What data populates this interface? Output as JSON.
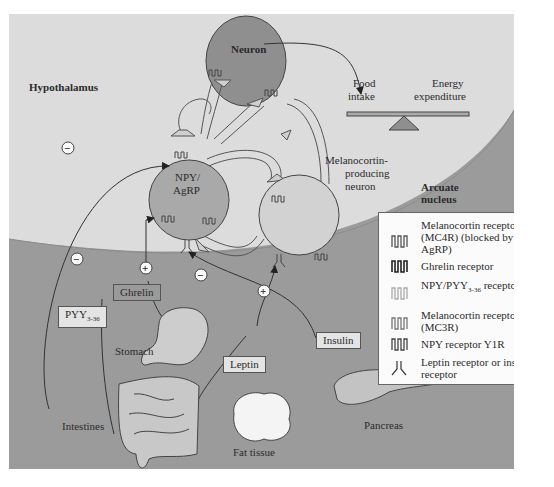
{
  "regions": {
    "hypothalamus": "Hypothalamus",
    "arcuate_nucleus_line1": "Arcuate",
    "arcuate_nucleus_line2": "nucleus"
  },
  "neurons": {
    "top": "Neuron",
    "npy_line1": "NPY/",
    "npy_line2": "AgRP",
    "melanocortin_line1": "Melanocortin-",
    "melanocortin_line2": "producing",
    "melanocortin_line3": "neuron"
  },
  "balance": {
    "left_line1": "Food",
    "left_line2": "intake",
    "right_line1": "Energy",
    "right_line2": "expenditure"
  },
  "hormones": {
    "pyy": "PYY",
    "pyy_sub": "3-36",
    "ghrelin": "Ghrelin",
    "leptin": "Leptin",
    "insulin": "Insulin"
  },
  "organs": {
    "stomach": "Stomach",
    "intestines": "Intestines",
    "fat_tissue": "Fat tissue",
    "pancreas": "Pancreas"
  },
  "signs": {
    "minus": "−",
    "plus": "+"
  },
  "legend": {
    "items": [
      {
        "icon": "mc4r-receptor-icon",
        "text": "Melanocortin receptor (MC4R) (blocked by AgRP)"
      },
      {
        "icon": "ghrelin-receptor-icon",
        "text": "Ghrelin receptor"
      },
      {
        "icon": "y2r-receptor-icon",
        "text_pre": "NPY/PYY",
        "text_sub": "3-36",
        "text_post": " receptor Y2R"
      },
      {
        "icon": "mc3r-receptor-icon",
        "text": "Melanocortin receptor (MC3R)"
      },
      {
        "icon": "y1r-receptor-icon",
        "text": "NPY receptor Y1R"
      },
      {
        "icon": "leptin-insulin-receptor-icon",
        "text": "Leptin receptor or insulin receptor"
      }
    ]
  },
  "colors": {
    "brain_bg": "#dcdcdc",
    "body_bg": "#9b9b9b",
    "neuron_dark": "#8f8f8f",
    "npy_neuron": "#a9a9a9",
    "melanocortin_neuron": "#d2d2d2",
    "legend_bg": "#fbfbfb"
  }
}
